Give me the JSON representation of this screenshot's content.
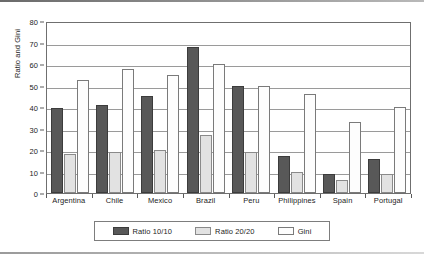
{
  "chart_data": {
    "type": "bar",
    "title": "",
    "xlabel": "",
    "ylabel": "Ratio and Gini",
    "ylim": [
      0,
      80
    ],
    "ytick_step": 10,
    "yticks": [
      0,
      10,
      20,
      30,
      40,
      50,
      60,
      70,
      80
    ],
    "grid": "horizontal",
    "legend_position": "bottom",
    "categories": [
      "Argentina",
      "Chile",
      "Mexico",
      "Brazil",
      "Peru",
      "Philippines",
      "Spain",
      "Portugal"
    ],
    "series": [
      {
        "name": "Ratio 10/10",
        "color": "#585858",
        "values": [
          39.5,
          41,
          45,
          68,
          50,
          17,
          9,
          16
        ]
      },
      {
        "name": "Ratio 20/20",
        "color": "#E2E2E2",
        "values": [
          18,
          19,
          20,
          27,
          19,
          10,
          6,
          9
        ]
      },
      {
        "name": "Gini",
        "color": "#FDFDFD",
        "values": [
          52.5,
          57.5,
          55,
          60,
          50,
          46,
          33,
          40
        ]
      }
    ]
  }
}
